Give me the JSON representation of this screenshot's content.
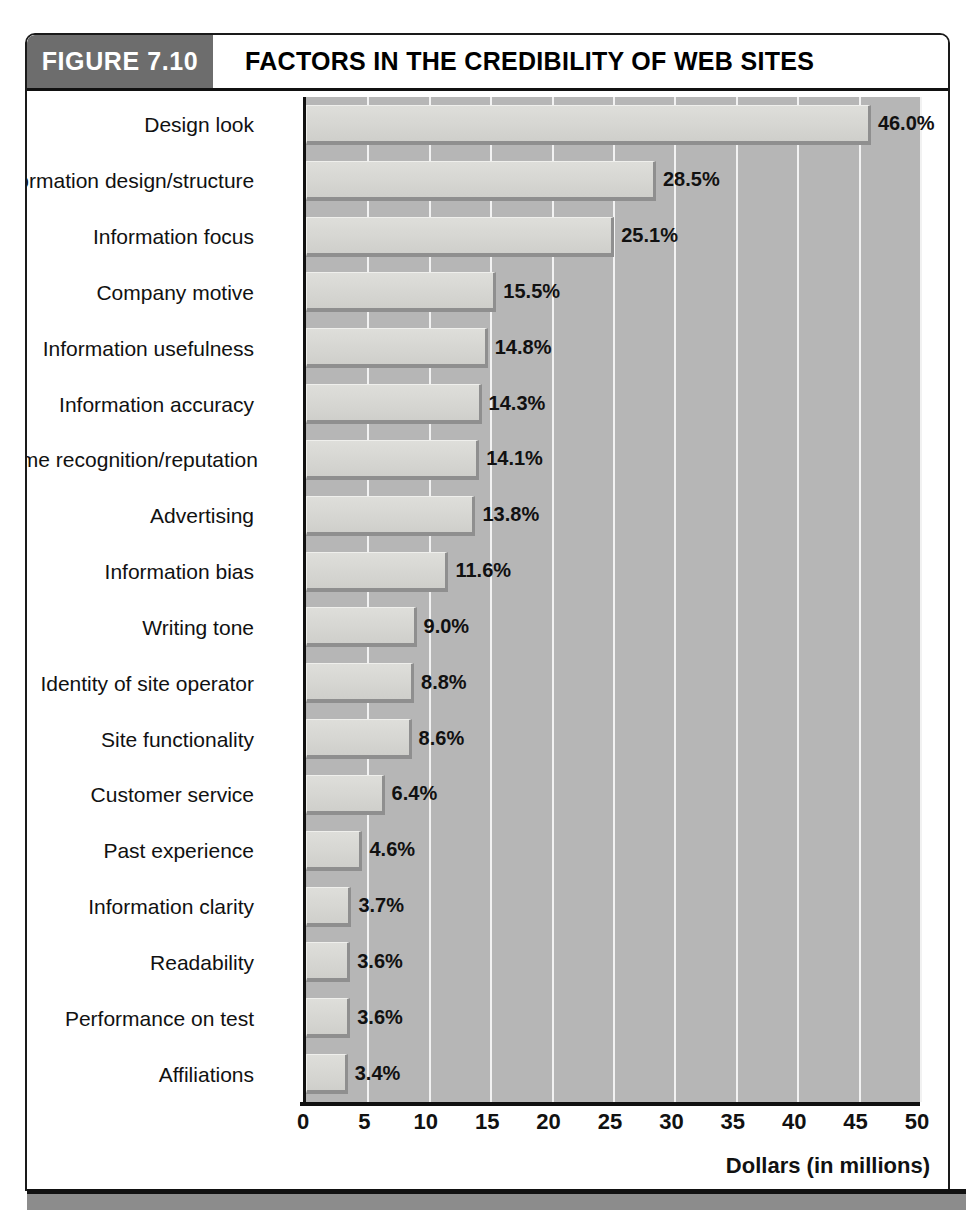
{
  "figure": {
    "tag": "FIGURE 7.10",
    "title": "FACTORS IN THE CREDIBILITY OF WEB SITES"
  },
  "colors": {
    "tag_background": "#6d6d6d",
    "plot_background": "#b6b6b6",
    "bar_fill": "#d9d9d5",
    "bar_shadow": "#8f8f8f",
    "gridline": "#f2f2f2",
    "frame_border": "#1a1a1a",
    "text": "#111111"
  },
  "chart_data": {
    "type": "bar",
    "orientation": "horizontal",
    "title": "FACTORS IN THE CREDIBILITY OF WEB SITES",
    "xlabel": "Dollars (in millions)",
    "ylabel": "",
    "xlim": [
      0,
      50
    ],
    "xticks": [
      0,
      5,
      10,
      15,
      20,
      25,
      30,
      35,
      40,
      45,
      50
    ],
    "grid": true,
    "legend": null,
    "categories": [
      "Design look",
      "Information design/structure",
      "Information focus",
      "Company motive",
      "Information usefulness",
      "Information accuracy",
      "Name recognition/reputation",
      "Advertising",
      "Information bias",
      "Writing tone",
      "Identity of site operator",
      "Site functionality",
      "Customer service",
      "Past experience",
      "Information clarity",
      "Readability",
      "Performance on test",
      "Affiliations"
    ],
    "values": [
      46.0,
      28.5,
      25.1,
      15.5,
      14.8,
      14.3,
      14.1,
      13.8,
      11.6,
      9.0,
      8.8,
      8.6,
      6.4,
      4.6,
      3.7,
      3.6,
      3.6,
      3.4
    ],
    "value_labels": [
      "46.0%",
      "28.5%",
      "25.1%",
      "15.5%",
      "14.8%",
      "14.3%",
      "14.1%",
      "13.8%",
      "11.6%",
      "9.0%",
      "8.8%",
      "8.6%",
      "6.4%",
      "4.6%",
      "3.7%",
      "3.6%",
      "3.6%",
      "3.4%"
    ]
  }
}
